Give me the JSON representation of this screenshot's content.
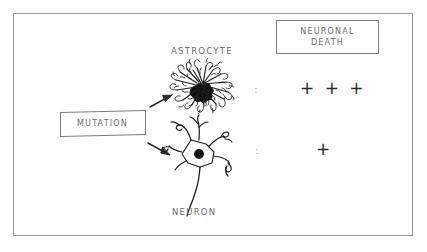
{
  "figure": {
    "kind": "hand-drawn-biology-diagram",
    "border_color": "#9a9a9a",
    "ink_color": "#2b2b2b",
    "text_color": "#6e6e6e",
    "background": "#ffffff"
  },
  "nodes": {
    "mutation": {
      "label": "MUTATION"
    },
    "outcome": {
      "line1": "NEURONAL",
      "line2": "DEATH"
    }
  },
  "cells": [
    {
      "name": "astrocyte",
      "label": "ASTROCYTE",
      "separator": ":",
      "score": "+ + +",
      "score_magnitude": 3
    },
    {
      "name": "neuron",
      "label": "NEURON",
      "separator": ":",
      "score": "+",
      "score_magnitude": 1
    }
  ],
  "arrows": [
    {
      "name": "arrow-to-astrocyte",
      "from": "mutation",
      "to": "astrocyte"
    },
    {
      "name": "arrow-to-neuron",
      "from": "mutation",
      "to": "neuron"
    }
  ]
}
